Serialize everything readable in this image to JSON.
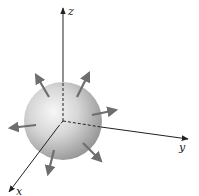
{
  "diagram": {
    "axes": {
      "z": {
        "label": "z"
      },
      "y": {
        "label": "y"
      },
      "x": {
        "label": "x"
      }
    },
    "sphere": {
      "center": [
        63,
        121
      ],
      "radius": 39
    },
    "arrows_count": 6,
    "colors": {
      "axis": "#222222",
      "arrow": "#6e6e6e",
      "sphere_light": "#f4f4f4",
      "sphere_dark": "#9a9a9a"
    }
  }
}
